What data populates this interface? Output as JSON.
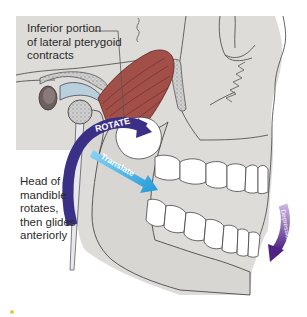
{
  "figure": {
    "type": "anatomical-diagram"
  },
  "labels": {
    "muscle_callout": {
      "lines": [
        "Inferior portion",
        "of lateral pterygoid",
        "contracts"
      ]
    },
    "condyle_callout": {
      "lines": [
        "Head of",
        "mandible",
        "rotates,",
        "then glides",
        "anteriorly"
      ]
    }
  },
  "arrows": {
    "rotate": {
      "label": "ROTATE",
      "color": "#3b2f86"
    },
    "translate": {
      "label": "Translate",
      "color": "#2aa3dd"
    },
    "depression": {
      "label": "Depression",
      "color": "#5a2d8c"
    }
  },
  "colors": {
    "background": "#ffffff",
    "panel": "#dcdad7",
    "bone": "#d6d4d1",
    "muscle": "#a0524d",
    "outline": "#4a4a4a",
    "teeth": "#ffffff"
  }
}
